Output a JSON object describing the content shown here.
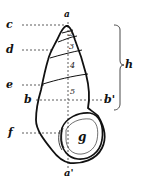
{
  "diagram": {
    "labels": {
      "apex": "a",
      "base": "a'",
      "width_left": "b",
      "width_right": "b'",
      "c": "c",
      "d": "d",
      "e": "e",
      "f": "f",
      "aperture": "g",
      "height": "h"
    },
    "whorl_numbers": [
      "2",
      "3",
      "4",
      "5"
    ],
    "colors": {
      "ink": "#111111",
      "background": "#ffffff"
    }
  }
}
